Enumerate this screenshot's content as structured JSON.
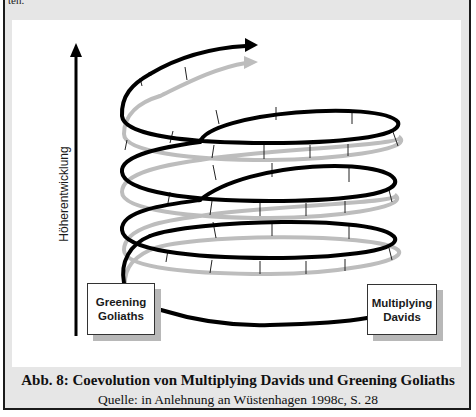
{
  "figure": {
    "cut_off_text": "ten.",
    "axis_label": "Höherentwicklung",
    "boxes": {
      "left": "Greening\nGoliaths",
      "right": "Multiplying\nDavids"
    },
    "caption": "Abb. 8: Coevolution von Multiplying Davids und Greening Goliaths",
    "source": "Quelle: in Anlehnung an Wüstenhagen 1998c, S. 28",
    "colors": {
      "primary_spiral": "#000000",
      "secondary_spiral": "#bdbdbd",
      "frame_background": "#e6e6e6",
      "panel_background": "#ffffff",
      "box_shadow": "#b8b8b8"
    }
  }
}
